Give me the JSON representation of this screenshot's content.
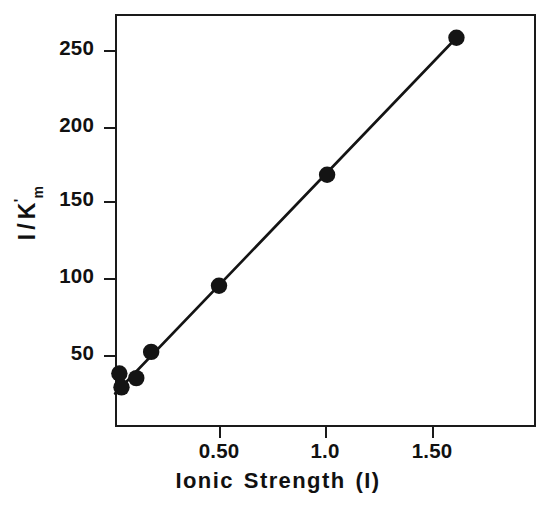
{
  "chart_data": {
    "type": "scatter",
    "title": "",
    "xlabel": "Ionic Strength (I)",
    "ylabel": "I / K'm",
    "ylabel_parts": {
      "numerator": "I",
      "slash": "/",
      "denominator": "K",
      "prime": "'",
      "subscript": "m"
    },
    "xlabel_words": [
      "Ionic",
      "Strength",
      "(I)"
    ],
    "x": [
      0.03,
      0.04,
      0.11,
      0.18,
      0.5,
      1.01,
      1.62
    ],
    "values": [
      38,
      29,
      35,
      52,
      95,
      167,
      256
    ],
    "points": [
      {
        "x": 0.03,
        "y": 38
      },
      {
        "x": 0.04,
        "y": 29
      },
      {
        "x": 0.11,
        "y": 35
      },
      {
        "x": 0.18,
        "y": 52
      },
      {
        "x": 0.5,
        "y": 95
      },
      {
        "x": 1.01,
        "y": 167
      },
      {
        "x": 1.62,
        "y": 256
      }
    ],
    "fit_line": {
      "x0": 0.01,
      "y0": 25,
      "x1": 1.62,
      "y1": 256
    },
    "xlim": [
      -0.03,
      1.94
    ],
    "ylim": [
      -4,
      264
    ],
    "xticks": [
      0.5,
      1.0,
      1.5
    ],
    "xticklabels": [
      "0.50",
      "1.0",
      "1.50"
    ],
    "yticks": [
      50,
      100,
      150,
      200,
      250
    ],
    "yticklabels": [
      "50",
      "100",
      "150",
      "200",
      "250"
    ],
    "grid": false,
    "legend": null,
    "marker": "filled-circle",
    "marker_color": "#141414",
    "line_color": "#141414"
  }
}
